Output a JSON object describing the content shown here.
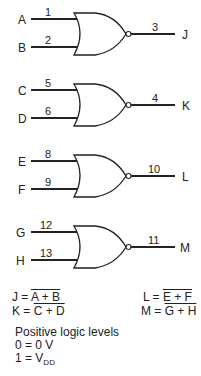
{
  "gates": [
    {
      "inputs": [
        {
          "signal": "A",
          "pin": "1"
        },
        {
          "signal": "B",
          "pin": "2"
        }
      ],
      "output": {
        "signal": "J",
        "pin": "3"
      }
    },
    {
      "inputs": [
        {
          "signal": "C",
          "pin": "5"
        },
        {
          "signal": "D",
          "pin": "6"
        }
      ],
      "output": {
        "signal": "K",
        "pin": "4"
      }
    },
    {
      "inputs": [
        {
          "signal": "E",
          "pin": "8"
        },
        {
          "signal": "F",
          "pin": "9"
        }
      ],
      "output": {
        "signal": "L",
        "pin": "10"
      }
    },
    {
      "inputs": [
        {
          "signal": "G",
          "pin": "12"
        },
        {
          "signal": "H",
          "pin": "13"
        }
      ],
      "output": {
        "signal": "M",
        "pin": "11"
      }
    }
  ],
  "equations": [
    {
      "lhs": "J =",
      "rhs": "A + B"
    },
    {
      "lhs": "K =",
      "rhs": "C + D"
    },
    {
      "lhs": "L =",
      "rhs": "E + F"
    },
    {
      "lhs": "M =",
      "rhs": "G + H"
    }
  ],
  "notes": {
    "title": "Positive logic levels",
    "zero": "0 = 0 V",
    "one_prefix": "1 = V",
    "one_sub": "DD"
  }
}
